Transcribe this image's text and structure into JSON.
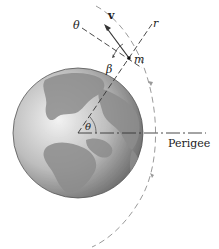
{
  "diagram": {
    "labels": {
      "theta_axis": "θ",
      "velocity": "v",
      "radial_axis": "r",
      "mass": "m",
      "flight_angle": "β",
      "polar_angle": "θ",
      "perigee": "Perigee"
    },
    "colors": {
      "line": "#333333",
      "dashed": "#555555",
      "orbit": "#9a9a9a",
      "earth_dark": "#6e6e6e",
      "earth_light": "#d8d8d8",
      "land": "#8a8a8a"
    }
  }
}
